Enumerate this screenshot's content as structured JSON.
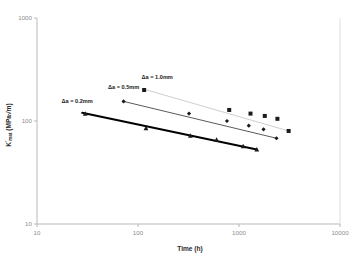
{
  "chart_data": {
    "type": "scatter",
    "title": "",
    "xlabel": "Time (h)",
    "ylabel": "K'mat (MPa√m)",
    "ylabel_parts": {
      "main": "K",
      "superscript": "'",
      "subscript": "mat",
      "units": " (MPa√m)"
    },
    "xscale": "log",
    "yscale": "log",
    "xlim": [
      10,
      10000
    ],
    "ylim": [
      10,
      1000
    ],
    "xticks": [
      10,
      100,
      1000,
      10000
    ],
    "xtick_labels": [
      "10",
      "100",
      "1000",
      "10000"
    ],
    "yticks": [
      10,
      100,
      1000
    ],
    "ytick_labels": [
      "10",
      "100",
      "1000"
    ],
    "grid": false,
    "legend_position": "inline-annotations",
    "series": [
      {
        "name": "Δa = 0.2mm",
        "label": "Δa = 0.2mm",
        "marker": "triangle",
        "color": "#1b1b1b",
        "line_color": "#000000",
        "line_width": 2.0,
        "label_x": 25,
        "label_y": 150,
        "points": [
          {
            "x": 30,
            "y": 118
          },
          {
            "x": 120,
            "y": 85
          },
          {
            "x": 330,
            "y": 72
          },
          {
            "x": 600,
            "y": 66
          },
          {
            "x": 1100,
            "y": 57
          },
          {
            "x": 1500,
            "y": 53
          }
        ],
        "fit": [
          {
            "x": 28,
            "y": 120
          },
          {
            "x": 1500,
            "y": 53
          }
        ]
      },
      {
        "name": "Δa = 0.5mm",
        "label": "Δa = 0.5mm",
        "marker": "diamond",
        "color": "#1b1b1b",
        "line_color": "#5a5a5a",
        "line_width": 1.0,
        "label_x": 72,
        "label_y": 205,
        "points": [
          {
            "x": 72,
            "y": 155
          },
          {
            "x": 320,
            "y": 118
          },
          {
            "x": 760,
            "y": 100
          },
          {
            "x": 1250,
            "y": 90
          },
          {
            "x": 1750,
            "y": 83
          },
          {
            "x": 2350,
            "y": 68
          }
        ],
        "fit": [
          {
            "x": 72,
            "y": 155
          },
          {
            "x": 2350,
            "y": 68
          }
        ]
      },
      {
        "name": "Δa = 1.0mm",
        "label": "Δa = 1.0mm",
        "marker": "square",
        "color": "#1b1b1b",
        "line_color": "#cfcfcf",
        "line_width": 1.0,
        "label_x": 155,
        "label_y": 255,
        "points": [
          {
            "x": 115,
            "y": 200
          },
          {
            "x": 800,
            "y": 128
          },
          {
            "x": 1300,
            "y": 118
          },
          {
            "x": 1800,
            "y": 112
          },
          {
            "x": 2400,
            "y": 105
          },
          {
            "x": 3100,
            "y": 80
          }
        ],
        "fit": [
          {
            "x": 112,
            "y": 205
          },
          {
            "x": 3100,
            "y": 80
          }
        ]
      }
    ]
  },
  "colors": {
    "axis": "#b9b9b9",
    "tick_text": "#8d8d8d",
    "title_text": "#2b2b2b",
    "series_dark": "#000000",
    "series_mid": "#5a5a5a",
    "series_light": "#cfcfcf",
    "marker": "#1b1b1b",
    "background": "#ffffff"
  }
}
